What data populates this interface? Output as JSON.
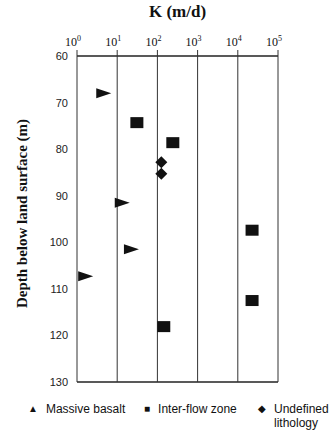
{
  "chart_data": {
    "type": "scatter",
    "title": "K (m/d)",
    "xlabel": "K (m/d)",
    "ylabel": "Depth below land surface (m)",
    "xscale": "log",
    "xlim": [
      1,
      100000
    ],
    "ylim": [
      60,
      130
    ],
    "y_inverted": true,
    "x_tick_labels": [
      "10^0",
      "10^1",
      "10^2",
      "10^3",
      "10^4",
      "10^5"
    ],
    "y_tick_labels": [
      "60",
      "70",
      "80",
      "90",
      "100",
      "110",
      "120",
      "130"
    ],
    "grid": "vertical",
    "legend_position": "bottom",
    "series": [
      {
        "name": "Massive basalt",
        "marker": "triangle-right",
        "points": [
          {
            "k": 4.5,
            "depth": 68
          },
          {
            "k": 13,
            "depth": 91.5
          },
          {
            "k": 22,
            "depth": 101.5
          },
          {
            "k": 1.6,
            "depth": 107.3
          }
        ]
      },
      {
        "name": "Inter-flow zone",
        "marker": "square",
        "points": [
          {
            "k": 30,
            "depth": 74.2
          },
          {
            "k": 235,
            "depth": 78.5
          },
          {
            "k": 22000,
            "depth": 97.3
          },
          {
            "k": 22000,
            "depth": 112.4
          },
          {
            "k": 140,
            "depth": 118
          }
        ]
      },
      {
        "name": "Undefined lithology",
        "marker": "diamond",
        "points": [
          {
            "k": 125,
            "depth": 82.8
          },
          {
            "k": 125,
            "depth": 85.3
          }
        ]
      }
    ]
  },
  "legend": {
    "massive": "Massive basalt",
    "interflow": "Inter-flow zone",
    "undefined_line1": "Undefined",
    "undefined_line2": "lithology"
  },
  "labels": {
    "title": "K (m/d)",
    "ylabel": "Depth below land surface (m)"
  }
}
